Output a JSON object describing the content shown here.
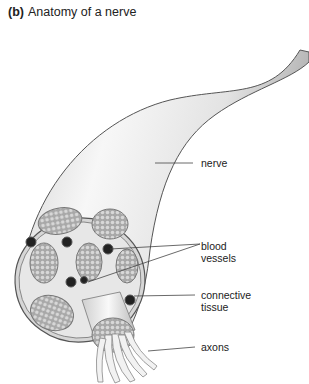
{
  "figure": {
    "panel_letter": "(b)",
    "title": "Anatomy of a nerve"
  },
  "labels": {
    "nerve": "nerve",
    "blood_vessels_line1": "blood",
    "blood_vessels_line2": "vessels",
    "connective_tissue_line1": "connective",
    "connective_tissue_line2": "tissue",
    "axons": "axons"
  },
  "colors": {
    "nerve_fill": "#e9e9e9",
    "outline": "#555555",
    "fascicle": "#9a9a9a",
    "vessel": "#222222",
    "text": "#222222"
  }
}
